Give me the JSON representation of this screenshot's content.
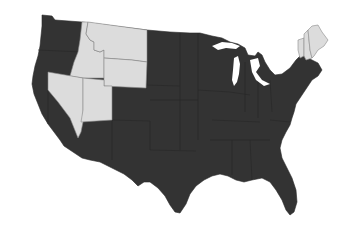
{
  "map": {
    "title": "",
    "region": "United States (contiguous)",
    "colors": {
      "highlighted": "#dcdcdc",
      "default": "#333333",
      "background": "#ffffff",
      "border_light": "#8a8a8a"
    },
    "highlighted_states": [
      "Idaho",
      "Montana",
      "Wyoming",
      "Nevada",
      "Utah",
      "Maine",
      "New Hampshire",
      "Vermont"
    ],
    "legend": []
  }
}
